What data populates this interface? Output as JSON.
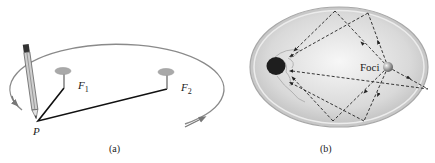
{
  "figure": {
    "panel_a": {
      "caption": "(a)",
      "labels": {
        "point": "P",
        "focus1": "F",
        "focus1_sub": "1",
        "focus2": "F",
        "focus2_sub": "2"
      },
      "description": "Drawing an ellipse with a string looped around two pins at foci F1 and F2 and a pencil at point P"
    },
    "panel_b": {
      "caption": "(b)",
      "labels": {
        "foci": "Foci"
      },
      "description": "Elliptical chamber: waves from one focus reflect off the wall and converge at the other focus"
    }
  },
  "colors": {
    "ellipse_stroke": "#8a8a8a",
    "pin_head": "#a9a9a9",
    "string": "#111111",
    "chamber_rim": "#b5b5b5",
    "chamber_fill": "#d8d8d8",
    "ray": "#222222",
    "dark_ball": "#1e1e1e"
  }
}
